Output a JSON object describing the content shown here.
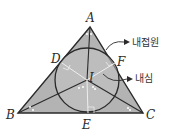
{
  "diagram": {
    "colors": {
      "triangle_fill": "#b3b3b3",
      "circle_fill": "#c4c4c4",
      "stroke": "#2a2a2a",
      "background": "#ffffff"
    },
    "points": {
      "A": {
        "label": "A",
        "x": 90,
        "y": 27
      },
      "B": {
        "label": "B",
        "x": 18,
        "y": 113
      },
      "C": {
        "label": "C",
        "x": 143,
        "y": 113
      },
      "D": {
        "label": "D",
        "x": 62,
        "y": 63
      },
      "E": {
        "label": "E",
        "x": 88,
        "y": 113
      },
      "F": {
        "label": "F",
        "x": 115,
        "y": 63
      },
      "I": {
        "label": "I",
        "x": 87,
        "y": 80
      }
    },
    "incircle_radius": 32,
    "annotations": {
      "incircle": "내접원",
      "incenter": "내심"
    }
  }
}
